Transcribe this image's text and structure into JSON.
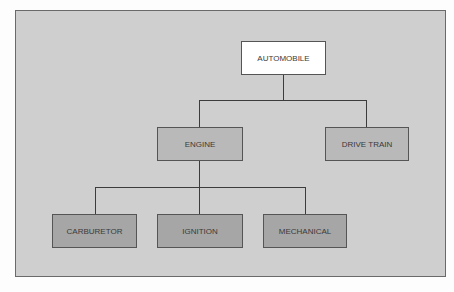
{
  "diagram": {
    "type": "hierarchy",
    "root": {
      "label": "AUTOMOBILE",
      "children": [
        {
          "label": "ENGINE",
          "children": [
            {
              "label": "CARBURETOR"
            },
            {
              "label": "IGNITION"
            },
            {
              "label": "MECHANICAL"
            }
          ]
        },
        {
          "label": "DRIVE TRAIN"
        }
      ]
    },
    "colors": {
      "background": "#cfcfcf",
      "root_fill": "#ffffff",
      "level1_fill": "#b9b9b9",
      "level2_fill": "#a6a6a6",
      "line": "#3c3c3c"
    }
  }
}
